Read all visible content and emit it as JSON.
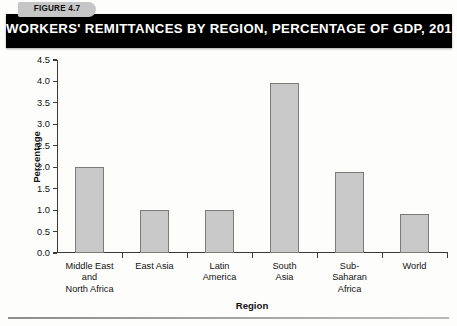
{
  "figure": {
    "tab_label": "FIGURE 4.7",
    "title": "WORKERS' REMITTANCES BY REGION, PERCENTAGE OF GDP, 2010"
  },
  "colors": {
    "banner_background": "#000000",
    "banner_text": "#ffffff",
    "tab_background": "#c6c6c6",
    "bar_fill": "#c9c9c9",
    "bar_stroke": "#7b7b7b",
    "axis": "#3a3a3a"
  },
  "chart_data": {
    "type": "bar",
    "title": "WORKERS' REMITTANCES BY REGION, PERCENTAGE OF GDP, 2010",
    "xlabel": "Region",
    "ylabel": "Percentage",
    "categories": [
      "Middle East and North Africa",
      "East Asia",
      "Latin America",
      "South Asia",
      "Sub-Saharan Africa",
      "World"
    ],
    "category_lines": [
      [
        "Middle East",
        "and",
        "North Africa"
      ],
      [
        "East Asia"
      ],
      [
        "Latin",
        "America"
      ],
      [
        "South",
        "Asia"
      ],
      [
        "Sub-",
        "Saharan",
        "Africa"
      ],
      [
        "World"
      ]
    ],
    "values": [
      2.0,
      1.0,
      1.0,
      3.97,
      1.9,
      0.9
    ],
    "ylim": [
      0.0,
      4.5
    ],
    "ytick_labels": [
      "0.0",
      "0.5",
      "1.0",
      "1.5",
      "2.0",
      "2.5",
      "3.0",
      "3.5",
      "4.0",
      "4.5"
    ],
    "ytick_values": [
      0.0,
      0.5,
      1.0,
      1.5,
      2.0,
      2.5,
      3.0,
      3.5,
      4.0,
      4.5
    ],
    "grid": false,
    "legend": null
  }
}
